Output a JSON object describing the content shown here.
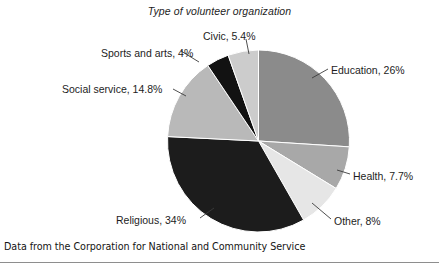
{
  "chart_data": {
    "type": "pie",
    "title": "Type of volunteer organization",
    "xlabel": "",
    "ylabel": "",
    "legend_position": "none",
    "labels_position": "outside-with-leader-lines",
    "start_angle_deg": 0,
    "direction": "clockwise",
    "categories": [
      "Education",
      "Health",
      "Other",
      "Religious",
      "Social service",
      "Sports and arts",
      "Civic"
    ],
    "values": [
      26,
      7.7,
      8,
      34,
      14.8,
      4,
      5.4
    ],
    "units": "percent",
    "total": 99.9,
    "colors": [
      "#8b8b8b",
      "#a8a8a8",
      "#e6e6e6",
      "#1c1c1c",
      "#b9b9b9",
      "#121212",
      "#cccccc"
    ],
    "slices": [
      {
        "name": "Education",
        "value": 26,
        "label": "Education, 26%",
        "color": "#8b8b8b"
      },
      {
        "name": "Health",
        "value": 7.7,
        "label": "Health, 7.7%",
        "color": "#a8a8a8"
      },
      {
        "name": "Other",
        "value": 8,
        "label": "Other, 8%",
        "color": "#e6e6e6"
      },
      {
        "name": "Religious",
        "value": 34,
        "label": "Religious, 34%",
        "color": "#1c1c1c"
      },
      {
        "name": "Social service",
        "value": 14.8,
        "label": "Social service, 14.8%",
        "color": "#b9b9b9"
      },
      {
        "name": "Sports and arts",
        "value": 4,
        "label": "Sports and arts, 4%",
        "color": "#121212"
      },
      {
        "name": "Civic",
        "value": 5.4,
        "label": "Civic, 5.4%",
        "color": "#cccccc"
      }
    ],
    "source_note": "Data from the Corporation for National and Community Service"
  },
  "figure": {
    "title": "Type of volunteer organization",
    "source_note": "Data from the Corporation for National and Community Service",
    "labels": {
      "education": "Education, 26%",
      "health": "Health, 7.7%",
      "other": "Other, 8%",
      "religious": "Religious, 34%",
      "social_service": "Social service, 14.8%",
      "sports_and_arts": "Sports and arts, 4%",
      "civic": "Civic, 5.4%"
    }
  }
}
